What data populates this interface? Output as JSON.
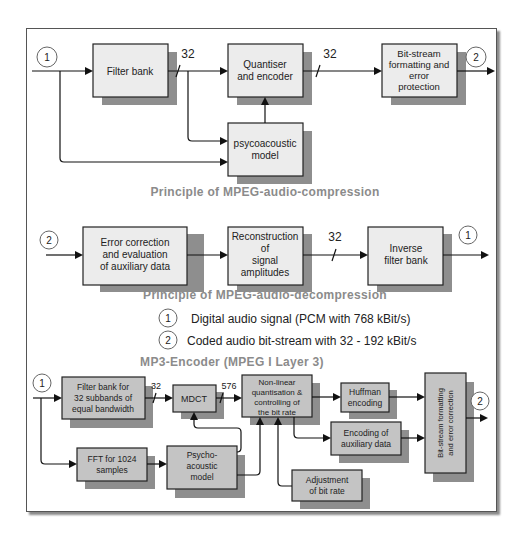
{
  "compression": {
    "title": "Principle of MPEG-audio-compression",
    "input_marker": "1",
    "output_marker": "2",
    "filter_bank": "Filter bank",
    "quantiser": [
      "Quantiser",
      "and encoder"
    ],
    "psycho": [
      "psycoacoustic",
      "model"
    ],
    "bitstream": [
      "Bit-stream",
      "formatting and",
      "error",
      "protection"
    ],
    "bus_label_1": "32",
    "bus_label_2": "32"
  },
  "decompression": {
    "title": "Principle of MPEG-audio-decompression",
    "input_marker": "2",
    "output_marker": "1",
    "error_correction": [
      "Error correction",
      "and evaluation",
      "of auxiliary data"
    ],
    "reconstruction": [
      "Reconstruction",
      "of",
      "signal",
      "amplitudes"
    ],
    "inverse_filter": [
      "Inverse",
      "filter bank"
    ],
    "bus_label": "32"
  },
  "legend": [
    {
      "marker": "1",
      "text": "Digital audio signal (PCM with 768 kBit/s)"
    },
    {
      "marker": "2",
      "text": "Coded audio bit-stream with 32 - 192 kBit/s"
    }
  ],
  "encoder": {
    "title": "MP3-Encoder (MPEG I Layer 3)",
    "input_marker": "1",
    "output_marker": "2",
    "filter_bank": [
      "Filter bank for",
      "32 subbands of",
      "equal bandwidth"
    ],
    "mdct": "MDCT",
    "nonlinear": [
      "Non-linear",
      "quantisation &",
      "controlling of",
      "the bit rate"
    ],
    "huffman": [
      "Huffman",
      "encoding"
    ],
    "aux": [
      "Encoding of",
      "auxiliary data"
    ],
    "bitstream_vertical": [
      "Bit-stream formatting",
      "and error correction"
    ],
    "fft": [
      "FFT for 1024",
      "samples"
    ],
    "psycho": [
      "Psycho-",
      "acoustic",
      "model"
    ],
    "adjustment": [
      "Adjustment",
      "of bit rate"
    ],
    "bus_label_1": "32",
    "bus_label_2": "576"
  }
}
